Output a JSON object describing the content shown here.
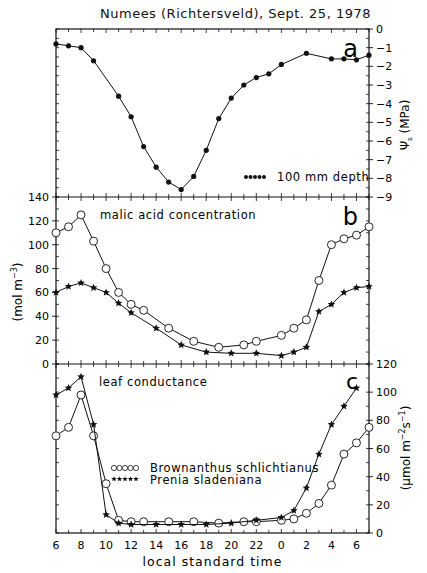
{
  "figure": {
    "title": "Numees (Richtersveld), Sept. 25, 1978",
    "xlabel": "local standard time",
    "x_tick_labels": [
      "6",
      "8",
      "10",
      "12",
      "14",
      "16",
      "18",
      "20",
      "22",
      "0",
      "2",
      "4",
      "6"
    ]
  },
  "chart_data": [
    {
      "panel": "a",
      "type": "line",
      "title": "Numees (Richtersveld), Sept. 25, 1978",
      "ylabel": "Ψs (MPa)",
      "y_axis_side": "right",
      "ylim": [
        -9,
        0
      ],
      "y_ticks": [
        0,
        -1,
        -2,
        -3,
        -4,
        -5,
        -6,
        -7,
        -8,
        -9
      ],
      "xlabel": "local standard time",
      "x_hours_elapsed": [
        0,
        1,
        2,
        3,
        5,
        6,
        7,
        8,
        9,
        10,
        11,
        12,
        13,
        14,
        15,
        16,
        17,
        18,
        20,
        22,
        23,
        24,
        25
      ],
      "x_clock": [
        "6",
        "7",
        "8",
        "9",
        "11",
        "12",
        "13",
        "14",
        "15",
        "16",
        "17",
        "18",
        "19",
        "20",
        "21",
        "22",
        "23",
        "0",
        "2",
        "4",
        "5",
        "6",
        "7"
      ],
      "legend": "100 mm depth",
      "legend_position": "lower right",
      "series": [
        {
          "name": "100 mm depth",
          "marker": "filled-circle",
          "values": [
            -0.8,
            -0.9,
            -1.0,
            -1.7,
            -3.6,
            -4.7,
            -6.3,
            -7.4,
            -8.2,
            -8.6,
            -7.9,
            -6.5,
            -4.8,
            -3.7,
            -3.0,
            -2.6,
            -2.4,
            -1.9,
            -1.3,
            -1.6,
            -1.6,
            -1.65,
            -1.4
          ]
        }
      ]
    },
    {
      "panel": "b",
      "type": "line",
      "annotation": "malic acid concentration",
      "ylabel": "(mol m⁻³)",
      "y_axis_side": "left",
      "ylim": [
        0,
        140
      ],
      "y_ticks": [
        0,
        20,
        40,
        60,
        80,
        100,
        120,
        140
      ],
      "series": [
        {
          "name": "Brownanthus schlichtianus",
          "marker": "open-circle",
          "x_hours_elapsed": [
            0,
            1,
            2,
            3,
            4,
            5,
            6,
            7,
            9,
            11,
            13,
            15,
            16,
            18,
            19,
            20,
            21,
            22,
            23,
            24,
            25
          ],
          "values": [
            110,
            115,
            125,
            103,
            80,
            60,
            50,
            45,
            30,
            19,
            14,
            16,
            19,
            24,
            30,
            37,
            70,
            100,
            105,
            108,
            115
          ]
        },
        {
          "name": "Prenia sladeniana",
          "marker": "filled-star",
          "x_hours_elapsed": [
            0,
            1,
            2,
            3,
            4,
            5,
            6,
            8,
            10,
            12,
            14,
            16,
            18,
            19,
            20,
            21,
            22,
            23,
            24,
            25
          ],
          "values": [
            60,
            65,
            68,
            64,
            60,
            51,
            43,
            30,
            16,
            10,
            9,
            9,
            7,
            10,
            14,
            44,
            50,
            60,
            64,
            65
          ]
        }
      ]
    },
    {
      "panel": "c",
      "type": "line",
      "annotation": "leaf conductance",
      "ylabel": "(μmol m⁻² s⁻¹)",
      "y_axis_side": "right",
      "ylim": [
        0,
        120
      ],
      "y_ticks": [
        0,
        20,
        40,
        60,
        80,
        100,
        120
      ],
      "legend": [
        "Brownanthus schlichtianus",
        "Prenia sladeniana"
      ],
      "legend_position": "center-left",
      "series": [
        {
          "name": "Brownanthus schlichtianus",
          "marker": "open-circle",
          "x_hours_elapsed": [
            0,
            1,
            2,
            3,
            4,
            5,
            6,
            7,
            9,
            11,
            13,
            15,
            16,
            18,
            19,
            20,
            21,
            22,
            23,
            24,
            25
          ],
          "values": [
            69,
            75,
            98,
            69,
            35,
            9,
            8,
            8,
            8,
            8,
            7,
            8,
            8,
            9,
            10,
            14,
            21,
            34,
            56,
            64,
            75
          ]
        },
        {
          "name": "Prenia sladeniana",
          "marker": "filled-star",
          "x_hours_elapsed": [
            0,
            1,
            2,
            3,
            4,
            5,
            6,
            8,
            10,
            12,
            14,
            16,
            18,
            19,
            20,
            21,
            22,
            23,
            24,
            25
          ],
          "values": [
            98,
            103,
            111,
            77,
            13,
            7,
            6,
            6,
            6,
            6,
            7,
            9,
            11,
            16,
            32,
            56,
            77,
            90,
            103
          ]
        }
      ]
    }
  ],
  "panels": {
    "a": {
      "letter": "a",
      "y_tick_labels": [
        "0",
        "−1",
        "−2",
        "−3",
        "−4",
        "−5",
        "−6",
        "−7",
        "−8",
        "−9"
      ],
      "ylabel": "Ψ",
      "ylabel_sub": "s",
      "ylabel_unit": "(MPa)",
      "legend_text": "100 mm depth"
    },
    "b": {
      "letter": "b",
      "annotation": "malic acid concentration",
      "y_tick_labels": [
        "0",
        "20",
        "40",
        "60",
        "80",
        "100",
        "120",
        "140"
      ],
      "ylabel": "(mol  m",
      "ylabel_sup": "−3",
      "ylabel_close": ")"
    },
    "c": {
      "letter": "c",
      "annotation": "leaf conductance",
      "y_tick_labels": [
        "0",
        "20",
        "40",
        "60",
        "80",
        "100",
        "120"
      ],
      "ylabel": "(μmol  m",
      "ylabel_sup": "−2",
      "ylabel_mid": "s",
      "ylabel_sup2": "−1",
      "ylabel_close": ")",
      "legend_1": "Brownanthus  schlichtianus",
      "legend_2": "Prenia  sladeniana"
    }
  }
}
